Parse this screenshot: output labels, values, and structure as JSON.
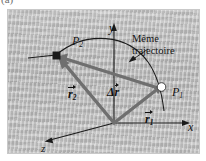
{
  "figure": {
    "panel_label": "(a)",
    "background_color": "#bdbdbd",
    "frame_border_color": "#c9c9c9",
    "vector_color": "#6b6b6b",
    "axis_color": "#1a1a1a",
    "point_marker_color": "#ffffff"
  },
  "axes": {
    "y_label": "y",
    "x_label": "x",
    "z_label": "z"
  },
  "points": [
    {
      "id": "P2",
      "base": "P",
      "subscript": "2",
      "marker": "filled-square"
    },
    {
      "id": "P1",
      "base": "P",
      "subscript": "1",
      "marker": "open-circle"
    }
  ],
  "vectors": [
    {
      "id": "r2",
      "base": "r",
      "subscript": "2",
      "arrow_over": true
    },
    {
      "id": "r1",
      "base": "r",
      "subscript": "1",
      "arrow_over": true
    },
    {
      "id": "dr",
      "base": "Δr",
      "subscript": "",
      "arrow_over": true
    }
  ],
  "annotations": {
    "trajectory_line1": "Même",
    "trajectory_line2": "trajectoire"
  }
}
